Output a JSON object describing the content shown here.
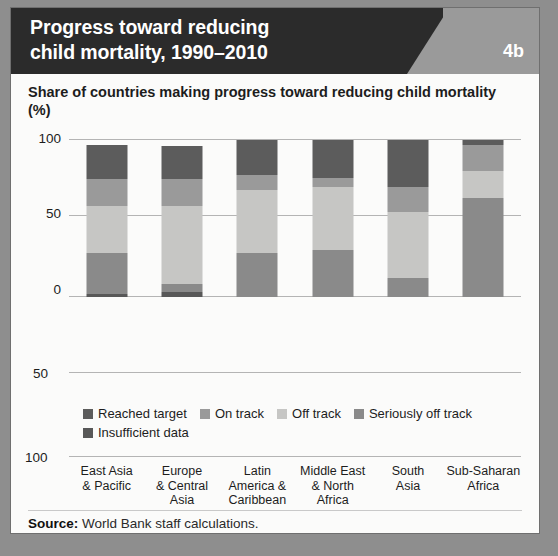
{
  "header": {
    "title": "Progress toward reducing\nchild mortality, 1990–2010",
    "badge": "4b"
  },
  "subtitle": "Share of countries making progress toward reducing child mortality",
  "unit_label": "(%)",
  "source": {
    "label": "Source:",
    "text": "World Bank staff calculations."
  },
  "extra_axis_labels": {
    "lower_50": "50",
    "lower_100": "100"
  },
  "colors": {
    "page_background": "#8e8e8e",
    "card_background": "#fbfbfa",
    "header_dark": "#2b2b2b",
    "header_gray": "#9a9a9a",
    "gridline": "#b4b4b4",
    "reached_target": "#5c5c5c",
    "on_track": "#9a9a9a",
    "off_track": "#c6c6c4",
    "seriously_off_track": "#8a8a8a",
    "insufficient_data": "#585858"
  },
  "legend": [
    {
      "label": "Reached target",
      "color": "#5c5c5c"
    },
    {
      "label": "On track",
      "color": "#9a9a9a"
    },
    {
      "label": "Off track",
      "color": "#c6c6c4"
    },
    {
      "label": "Seriously off track",
      "color": "#8a8a8a"
    },
    {
      "label": "Insufficient data",
      "color": "#585858"
    }
  ],
  "chart_data": {
    "type": "bar",
    "stacked": true,
    "title": "Share of countries making progress toward reducing child mortality",
    "xlabel": "",
    "ylabel": "(%)",
    "ylim": [
      0,
      100
    ],
    "yticks": [
      0,
      50,
      100
    ],
    "ytick_labels": [
      "0",
      "50",
      "100"
    ],
    "grid": true,
    "legend_position": "bottom",
    "categories": [
      "East Asia\n& Pacific",
      "Europe\n& Central\nAsia",
      "Latin\nAmerica &\nCaribbean",
      "Middle East\n& North\nAfrica",
      "South\nAsia",
      "Sub-Saharan\nAfrica"
    ],
    "series": [
      {
        "name": "Reached target",
        "color": "#5c5c5c",
        "values": [
          22,
          21,
          22,
          24,
          30,
          3
        ]
      },
      {
        "name": "On track",
        "color": "#9a9a9a",
        "values": [
          17,
          17,
          10,
          6,
          16,
          17
        ]
      },
      {
        "name": "Off track",
        "color": "#c6c6c4",
        "values": [
          30,
          50,
          40,
          40,
          42,
          17
        ]
      },
      {
        "name": "Seriously off track",
        "color": "#8a8a8a",
        "values": [
          26,
          5,
          28,
          30,
          12,
          63
        ]
      },
      {
        "name": "Insufficient data",
        "color": "#585858",
        "values": [
          2,
          3,
          0,
          0,
          0,
          0
        ]
      }
    ],
    "totals": [
      97,
      96,
      100,
      100,
      100,
      100
    ]
  }
}
